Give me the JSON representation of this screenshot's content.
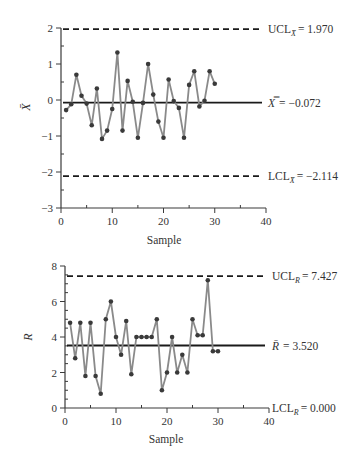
{
  "chart_data": [
    {
      "type": "line",
      "title": "",
      "xlabel": "Sample",
      "ylabel": "X̄",
      "xlim": [
        0,
        40
      ],
      "ylim": [
        -3,
        2
      ],
      "xticks": [
        0,
        10,
        20,
        30,
        40
      ],
      "xtick_labels": [
        "0",
        "10",
        "20",
        "30",
        "40"
      ],
      "yticks": [
        -3,
        -2,
        -1,
        0,
        1,
        2
      ],
      "ytick_labels": [
        "−3",
        "−2",
        "−1",
        "0",
        "1",
        "2"
      ],
      "grid": false,
      "series": [
        {
          "name": "Sample mean",
          "x": [
            1,
            2,
            3,
            4,
            5,
            6,
            7,
            8,
            9,
            10,
            11,
            12,
            13,
            14,
            15,
            16,
            17,
            18,
            19,
            20,
            21,
            22,
            23,
            24,
            25,
            26,
            27,
            28,
            29,
            30
          ],
          "values": [
            -0.28,
            -0.12,
            0.7,
            0.12,
            -0.1,
            -0.7,
            0.32,
            -1.08,
            -0.85,
            -0.25,
            1.32,
            -0.85,
            0.53,
            -0.05,
            -1.05,
            -0.08,
            1.0,
            0.15,
            -0.6,
            -1.05,
            0.57,
            -0.03,
            -0.22,
            -1.05,
            0.42,
            0.8,
            -0.18,
            -0.02,
            0.8,
            0.45
          ]
        }
      ],
      "control_lines": {
        "ucl": {
          "value": 1.97,
          "label_main": "UCL",
          "label_sub": "X̄",
          "label_value": "= 1.970"
        },
        "center": {
          "value": -0.072,
          "label_main": "X̿",
          "label_sub": "",
          "label_value": "= −0.072"
        },
        "lcl": {
          "value": -2.114,
          "label_main": "LCL",
          "label_sub": "X̄",
          "label_value": "= −2.114"
        }
      }
    },
    {
      "type": "line",
      "title": "",
      "xlabel": "Sample",
      "ylabel": "R",
      "xlim": [
        0,
        40
      ],
      "ylim": [
        0,
        8
      ],
      "xticks": [
        0,
        10,
        20,
        30,
        40
      ],
      "xtick_labels": [
        "0",
        "10",
        "20",
        "30",
        "40"
      ],
      "yticks": [
        0,
        2,
        4,
        6,
        8
      ],
      "ytick_labels": [
        "0",
        "2",
        "4",
        "6",
        "8"
      ],
      "grid": false,
      "series": [
        {
          "name": "Sample range",
          "x": [
            1,
            2,
            3,
            4,
            5,
            6,
            7,
            8,
            9,
            10,
            11,
            12,
            13,
            14,
            15,
            16,
            17,
            18,
            19,
            20,
            21,
            22,
            23,
            24,
            25,
            26,
            27,
            28,
            29,
            30
          ],
          "values": [
            4.8,
            2.8,
            4.8,
            1.8,
            4.8,
            1.8,
            0.8,
            5.0,
            6.0,
            4.0,
            3.0,
            4.9,
            1.9,
            4.0,
            4.0,
            4.0,
            4.0,
            5.0,
            1.0,
            2.0,
            4.0,
            2.0,
            3.0,
            2.0,
            5.0,
            4.1,
            4.1,
            7.2,
            3.2,
            3.2
          ]
        }
      ],
      "control_lines": {
        "ucl": {
          "value": 7.427,
          "label_main": "UCL",
          "label_sub": "R",
          "label_value": "= 7.427"
        },
        "center": {
          "value": 3.52,
          "label_main": "R̄",
          "label_sub": "",
          "label_value": "= 3.520"
        },
        "lcl": {
          "value": 0.0,
          "label_main": "LCL",
          "label_sub": "R",
          "label_value": "= 0.000"
        }
      }
    }
  ]
}
